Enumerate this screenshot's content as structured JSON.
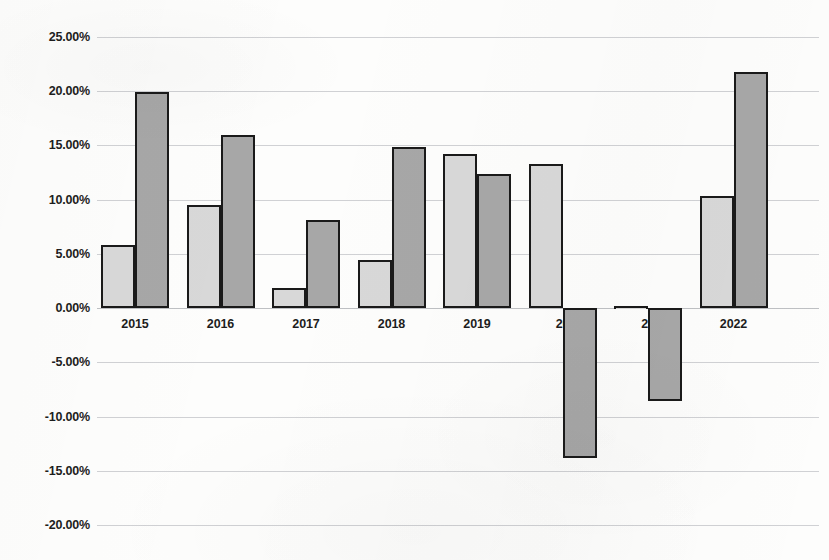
{
  "chart_data": {
    "type": "bar",
    "title": "",
    "subtitle": "",
    "xlabel": "",
    "ylabel": "",
    "categories": [
      "2015",
      "2016",
      "2017",
      "2018",
      "2019",
      "2020",
      "2021",
      "2022"
    ],
    "category_display_labels": [
      "2015",
      "2016",
      "2017",
      "2018",
      "2019",
      "20",
      "20",
      "2022"
    ],
    "series": [
      {
        "name": "series-1-light",
        "color": "#d8d8d8",
        "values": [
          5.8,
          9.5,
          1.9,
          4.4,
          14.2,
          13.3,
          0.2,
          10.3
        ]
      },
      {
        "name": "series-2-dark",
        "color": "#a7a7a7",
        "values": [
          19.9,
          16.0,
          8.1,
          14.9,
          12.4,
          -13.8,
          -8.6,
          21.8
        ]
      }
    ],
    "ylim": [
      -20,
      25
    ],
    "ytick_values": [
      25,
      20,
      15,
      10,
      5,
      0,
      -5,
      -10,
      -15,
      -20
    ],
    "ytick_labels": [
      "25.00%",
      "20.00%",
      "15.00%",
      "10.00%",
      "5.00%",
      "0.00%",
      "-5.00%",
      "-10.00%",
      "-15.00%",
      "-20.00%"
    ],
    "grid": true,
    "legend": "none",
    "value_format": "percent"
  },
  "axis": {
    "y_axis_name": "percent-axis",
    "x_axis_name": "year-axis"
  },
  "colors": {
    "background": "#fdfdfc",
    "gridline": "#6b7078",
    "bar_light": "#d8d8d8",
    "bar_dark": "#a7a7a7",
    "bar_border": "#1a1a1a",
    "text": "#1d1d1d"
  }
}
